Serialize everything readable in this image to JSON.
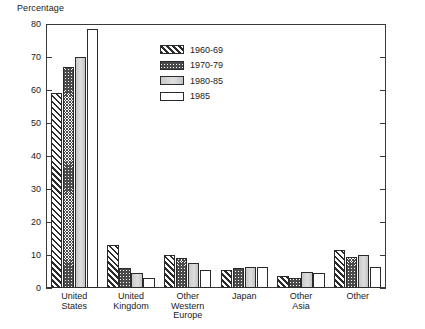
{
  "chart_data": {
    "type": "bar",
    "title": "",
    "xlabel": "",
    "ylabel": "Percentage",
    "ylim": [
      0,
      80
    ],
    "yticks": [
      0,
      10,
      20,
      30,
      40,
      50,
      60,
      70,
      80
    ],
    "grid": false,
    "legend_position": "upper-center-right",
    "categories": [
      "United States",
      "United Kingdom",
      "Other Western Europe",
      "Japan",
      "Other Asia",
      "Other"
    ],
    "series": [
      {
        "name": "1960-69",
        "pattern": "diagonal-hatch",
        "values": [
          59,
          13,
          10,
          5.5,
          3.5,
          11.5
        ]
      },
      {
        "name": "1970-79",
        "pattern": "stipple",
        "values": [
          67,
          6,
          9,
          6,
          3,
          9.5
        ]
      },
      {
        "name": "1980-85",
        "pattern": "solid-gray",
        "values": [
          70,
          4.5,
          7.5,
          6.5,
          5,
          10
        ]
      },
      {
        "name": "1985",
        "pattern": "white",
        "values": [
          78.5,
          3,
          5.5,
          6.5,
          4.5,
          6.5
        ]
      }
    ]
  },
  "axis": {
    "y_title": "Percentage",
    "tick_labels": [
      "80",
      "70",
      "60",
      "50",
      "40",
      "30",
      "20",
      "10",
      "0"
    ]
  },
  "category_labels": [
    [
      "United",
      "States"
    ],
    [
      "United",
      "Kingdom"
    ],
    [
      "Other",
      "Western",
      "Europe"
    ],
    [
      "Japan"
    ],
    [
      "Other",
      "Asia"
    ],
    [
      "Other"
    ]
  ],
  "legend": {
    "items": [
      {
        "label": "1960-69"
      },
      {
        "label": "1970-79"
      },
      {
        "label": "1980-85"
      },
      {
        "label": "1985"
      }
    ]
  },
  "caption": ""
}
